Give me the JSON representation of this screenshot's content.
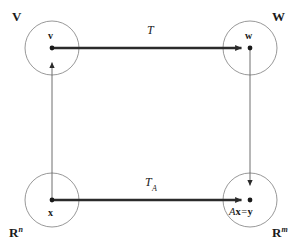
{
  "figure": {
    "type": "commutative-diagram",
    "background_color": "#ffffff",
    "circle_stroke_color": "#8c8c8c",
    "arrow_color": "#2b2b2b",
    "thin_arrow_color": "#6e6e6e",
    "text_color": "#1a1a1a"
  },
  "spaces": {
    "top_left": {
      "label": "V",
      "sup": ""
    },
    "top_right": {
      "label": "W",
      "sup": ""
    },
    "bottom_left": {
      "label": "R",
      "sup": "n"
    },
    "bottom_right": {
      "label": "R",
      "sup": "m"
    }
  },
  "nodes": {
    "v": {
      "label": "v"
    },
    "w": {
      "label": "w"
    },
    "x": {
      "label": "x"
    },
    "y": {
      "lhs_matrix": "A",
      "lhs_vector": "x",
      "operator": "=",
      "rhs": "y"
    }
  },
  "maps": {
    "top": {
      "label": "T",
      "sub": ""
    },
    "bottom": {
      "label": "T",
      "sub": "A"
    }
  }
}
